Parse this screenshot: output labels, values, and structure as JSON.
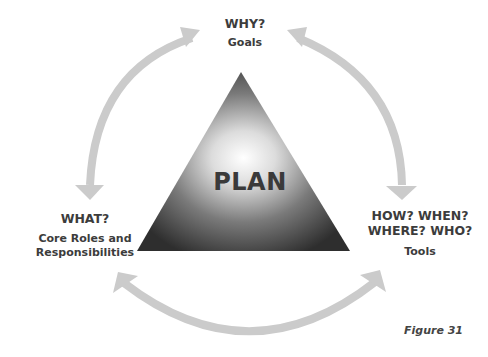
{
  "diagram": {
    "center": {
      "label": "PLAN",
      "shape": "triangle"
    },
    "nodes": [
      {
        "id": "top",
        "question": "WHY?",
        "subtitle": "Goals"
      },
      {
        "id": "left",
        "question": "WHAT?",
        "subtitle_line1": "Core Roles and",
        "subtitle_line2": "Responsibilities"
      },
      {
        "id": "right",
        "question_line1": "HOW? WHEN?",
        "question_line2": "WHERE? WHO?",
        "subtitle": "Tools"
      }
    ],
    "arrows": [
      {
        "from": "top",
        "to": "left",
        "bidirectional": true
      },
      {
        "from": "top",
        "to": "right",
        "bidirectional": true
      },
      {
        "from": "left",
        "to": "right",
        "bidirectional": true
      }
    ],
    "colors": {
      "arrow": "#c8c8c8",
      "triangle_dark": "#3a3a3a",
      "triangle_light": "#ffffff",
      "text": "#3c3c3c"
    },
    "caption": "Figure 31"
  }
}
